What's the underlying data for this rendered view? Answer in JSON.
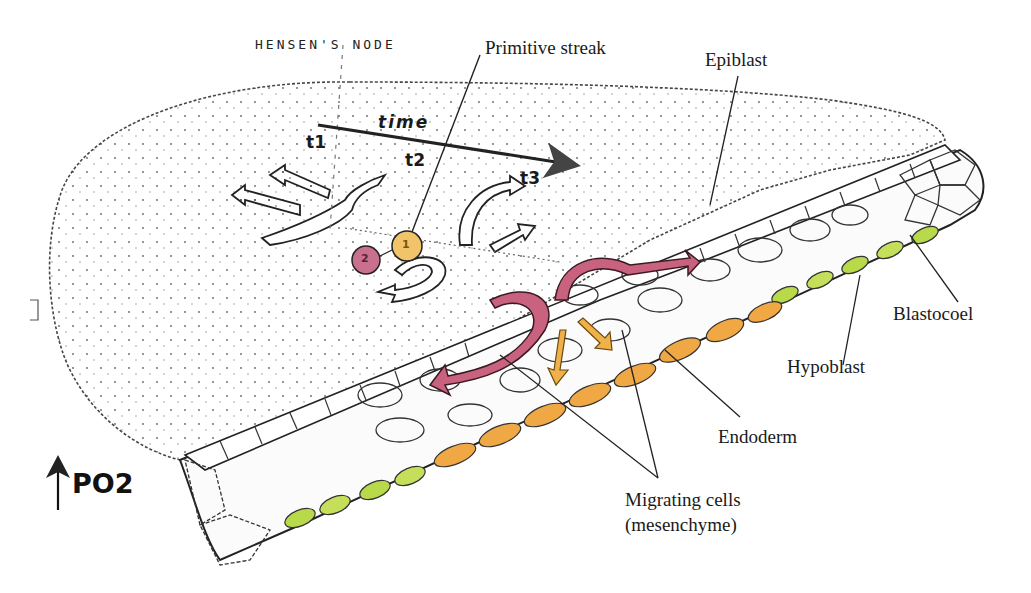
{
  "diagram": {
    "type": "biology-illustration",
    "handwritten_note": "HENSEN'S NODE",
    "labels": {
      "primitive_streak": "Primitive streak",
      "epiblast": "Epiblast",
      "blastocoel": "Blastocoel",
      "hypoblast": "Hypoblast",
      "endoderm": "Endoderm",
      "migrating_cells_line1": "Migrating cells",
      "migrating_cells_line2": "(mesenchyme)"
    },
    "time_axis": {
      "label": "time",
      "points": [
        "t1",
        "t2",
        "t3"
      ]
    },
    "cells": [
      {
        "number": "1",
        "color": "#f2c46a"
      },
      {
        "number": "2",
        "color": "#c9708f"
      }
    ],
    "indicator": {
      "symbol": "up-arrow",
      "label": "PO2"
    },
    "colors": {
      "ink": "#1a1a1a",
      "migration_arrows": "#c9627f",
      "endoderm_arrows": "#f0b04a",
      "endoderm_cells": "#f0a844",
      "hypoblast_cells": "#b8d94a",
      "background": "#ffffff"
    }
  }
}
